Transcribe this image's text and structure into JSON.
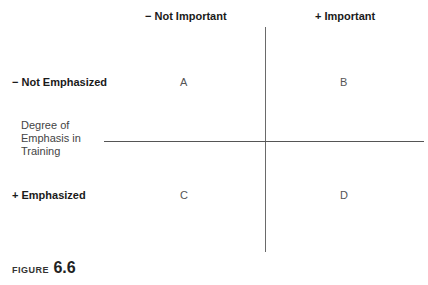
{
  "columns": {
    "left": "− Not Important",
    "right": "+ Important"
  },
  "rows": {
    "top": "− Not Emphasized",
    "bottom": "+ Emphasized"
  },
  "axis_label": "Degree of Emphasis in Training",
  "quadrants": {
    "top_left": "A",
    "top_right": "B",
    "bottom_left": "C",
    "bottom_right": "D"
  },
  "figure": {
    "label": "FIGURE",
    "number": "6.6"
  }
}
